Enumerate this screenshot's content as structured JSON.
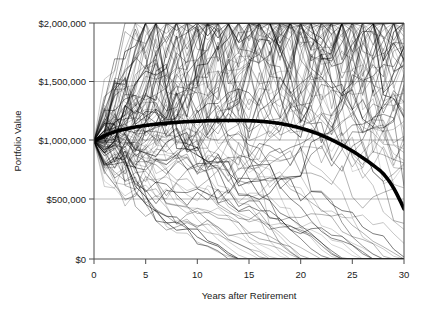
{
  "chart_data": {
    "type": "line",
    "title": "",
    "subtitle": "",
    "xlabel": "Years after Retirement",
    "ylabel": "Portfolio Value",
    "xlim": [
      0,
      30
    ],
    "ylim": [
      0,
      2000000
    ],
    "xticks": [
      0,
      5,
      10,
      15,
      20,
      25,
      30
    ],
    "xticklabels": [
      "0",
      "5",
      "10",
      "15",
      "20",
      "25",
      "30"
    ],
    "yticks": [
      0,
      500000,
      1000000,
      1500000,
      2000000
    ],
    "yticklabels": [
      "$0",
      "$500,000",
      "$1,000,000",
      "$1,500,000",
      "$2,000,000"
    ],
    "grid": "horizontal",
    "legend": "none",
    "annotations": [],
    "series_count": 101,
    "start_value": 1000000,
    "x": [
      0,
      1,
      2,
      3,
      4,
      5,
      6,
      7,
      8,
      9,
      10,
      11,
      12,
      13,
      14,
      15,
      16,
      17,
      18,
      19,
      20,
      21,
      22,
      23,
      24,
      25,
      26,
      27,
      28,
      29,
      30
    ],
    "series": [
      {
        "name": "Average portfolio value",
        "emphasis": "thick",
        "color": "#000000",
        "values": [
          1000000,
          1045000,
          1078000,
          1100000,
          1118000,
          1132000,
          1142000,
          1151000,
          1158000,
          1164000,
          1168000,
          1171000,
          1173000,
          1174000,
          1174000,
          1172000,
          1168000,
          1160000,
          1148000,
          1131000,
          1109000,
          1082000,
          1049000,
          1010000,
          965000,
          915000,
          858000,
          795000,
          722000,
          600000,
          425000
        ]
      },
      {
        "name": "simulated paths",
        "emphasis": "thin",
        "color": "#404040",
        "note": "approximately 100 individual Monte Carlo trials, drawn as thin gray lines; envelope upper bound peaks near $1,650,000 around year 8, lower bound reaches $0 starting about year 14"
      }
    ],
    "envelope": {
      "upper": [
        1000000,
        1140000,
        1270000,
        1330000,
        1400000,
        1450000,
        1490000,
        1560000,
        1650000,
        1600000,
        1620000,
        1560000,
        1520000,
        1560000,
        1500000,
        1460000,
        1440000,
        1460000,
        1410000,
        1340000,
        1300000,
        1250000,
        1230000,
        1200000,
        1160000,
        1120000,
        1110000,
        1060000,
        1010000,
        980000,
        950000
      ],
      "lower": [
        1000000,
        870000,
        800000,
        740000,
        690000,
        640000,
        590000,
        540000,
        480000,
        430000,
        380000,
        320000,
        260000,
        180000,
        90000,
        0,
        0,
        0,
        0,
        0,
        0,
        0,
        0,
        0,
        0,
        0,
        0,
        0,
        0,
        0,
        0
      ]
    }
  },
  "axes": {
    "ylabel_text": "Portfolio Value",
    "xlabel_text": "Years after Retirement"
  },
  "style": {
    "background": "#ffffff",
    "gridline_color": "#9a9a9a",
    "axis_color": "#4d4d4d",
    "median_color": "#000000",
    "path_color": "#404040"
  }
}
